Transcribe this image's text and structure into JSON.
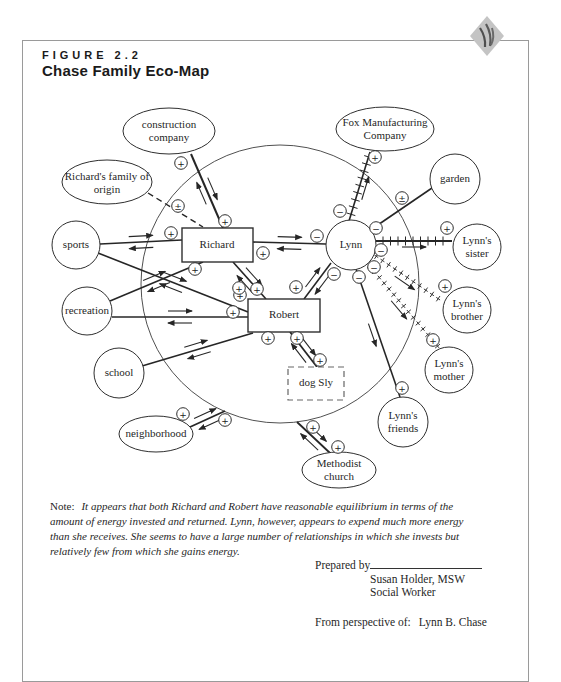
{
  "header": {
    "figure_label": "FIGURE 2.2",
    "title": "Chase Family Eco-Map"
  },
  "diagram": {
    "big_circle": {
      "cx": 280,
      "cy": 284,
      "r": 139
    },
    "nodes": [
      {
        "id": "construction-company",
        "label": "construction company",
        "shape": "ellipse",
        "cx": 169,
        "cy": 131,
        "rx": 46,
        "ry": 23
      },
      {
        "id": "fox-manufacturing",
        "label": "Fox Manufacturing Company",
        "shape": "ellipse",
        "cx": 385,
        "cy": 129,
        "rx": 49,
        "ry": 22
      },
      {
        "id": "richards-family-of-origin",
        "label": "Richard's family of origin",
        "shape": "ellipse",
        "cx": 107,
        "cy": 182,
        "rx": 45,
        "ry": 22
      },
      {
        "id": "garden",
        "label": "garden",
        "shape": "ellipse",
        "cx": 455,
        "cy": 179,
        "rx": 25,
        "ry": 25
      },
      {
        "id": "sports",
        "label": "sports",
        "shape": "ellipse",
        "cx": 76,
        "cy": 245,
        "rx": 24,
        "ry": 24
      },
      {
        "id": "lynns-sister",
        "label": "Lynn's sister",
        "shape": "ellipse",
        "cx": 477,
        "cy": 247,
        "rx": 24,
        "ry": 23
      },
      {
        "id": "lynn",
        "label": "Lynn",
        "shape": "ellipse",
        "cx": 351,
        "cy": 245,
        "rx": 25,
        "ry": 25
      },
      {
        "id": "richard",
        "label": "Richard",
        "shape": "rect",
        "x": 182,
        "y": 228,
        "w": 71,
        "h": 34
      },
      {
        "id": "recreation",
        "label": "recreation",
        "shape": "ellipse",
        "cx": 87,
        "cy": 311,
        "rx": 25,
        "ry": 24
      },
      {
        "id": "lynns-brother",
        "label": "Lynn's brother",
        "shape": "ellipse",
        "cx": 467,
        "cy": 310,
        "rx": 24,
        "ry": 23
      },
      {
        "id": "robert",
        "label": "Robert",
        "shape": "rect",
        "x": 248,
        "y": 299,
        "w": 72,
        "h": 33
      },
      {
        "id": "lynns-mother",
        "label": "Lynn's mother",
        "shape": "ellipse",
        "cx": 449,
        "cy": 370,
        "rx": 24,
        "ry": 23
      },
      {
        "id": "school",
        "label": "school",
        "shape": "ellipse",
        "cx": 119,
        "cy": 373,
        "rx": 25,
        "ry": 25
      },
      {
        "id": "dog-sly",
        "label": "dog Sly",
        "shape": "rect-dashed",
        "x": 288,
        "y": 367,
        "w": 56,
        "h": 33
      },
      {
        "id": "lynns-friends",
        "label": "Lynn's friends",
        "shape": "ellipse",
        "cx": 403,
        "cy": 422,
        "rx": 25,
        "ry": 25
      },
      {
        "id": "neighborhood",
        "label": "neighborhood",
        "shape": "ellipse",
        "cx": 156,
        "cy": 434,
        "rx": 37,
        "ry": 18
      },
      {
        "id": "methodist-church",
        "label": "Methodist church",
        "shape": "ellipse",
        "cx": 339,
        "cy": 470,
        "rx": 37,
        "ry": 18
      }
    ],
    "connections": [
      {
        "id": "construction-richard",
        "x1": 191,
        "y1": 154,
        "x2": 223,
        "y2": 228,
        "style": "solid",
        "w": 2,
        "arrows": "both"
      },
      {
        "id": "familyoforigin-richard",
        "x1": 148,
        "y1": 193,
        "x2": 203,
        "y2": 227,
        "style": "dashed",
        "w": 1.4,
        "arrows": "none"
      },
      {
        "id": "sports-richard",
        "x1": 100,
        "y1": 244,
        "x2": 182,
        "y2": 240,
        "style": "solid",
        "w": 1.6,
        "arrows": "both"
      },
      {
        "id": "sports-robert",
        "x1": 98,
        "y1": 253,
        "x2": 248,
        "y2": 312,
        "style": "solid",
        "w": 1.6,
        "arrows": "both"
      },
      {
        "id": "recreation-richard",
        "x1": 110,
        "y1": 301,
        "x2": 203,
        "y2": 262,
        "style": "solid",
        "w": 1.6,
        "arrows": "both"
      },
      {
        "id": "recreation-robert",
        "x1": 112,
        "y1": 317,
        "x2": 248,
        "y2": 317,
        "style": "solid",
        "w": 1.6,
        "arrows": "both"
      },
      {
        "id": "school-robert",
        "x1": 142,
        "y1": 366,
        "x2": 253,
        "y2": 333,
        "style": "solid",
        "w": 1.6,
        "arrows": "both"
      },
      {
        "id": "richard-lynn",
        "x1": 253,
        "y1": 242,
        "x2": 326,
        "y2": 244,
        "style": "solid",
        "w": 1.6,
        "arrows": "both"
      },
      {
        "id": "richard-robert",
        "x1": 233,
        "y1": 262,
        "x2": 266,
        "y2": 299,
        "style": "solid",
        "w": 1.6,
        "arrows": "both"
      },
      {
        "id": "lynn-robert",
        "x1": 331,
        "y1": 263,
        "x2": 304,
        "y2": 299,
        "style": "solid",
        "w": 1.6,
        "arrows": "both"
      },
      {
        "id": "lynn-fox",
        "x1": 349,
        "y1": 221,
        "x2": 370,
        "y2": 152,
        "style": "hatched",
        "w": 1.6,
        "arrows": "out"
      },
      {
        "id": "lynn-garden",
        "x1": 369,
        "y1": 231,
        "x2": 432,
        "y2": 188,
        "style": "solid",
        "w": 1.6,
        "arrows": "none"
      },
      {
        "id": "lynn-sister",
        "x1": 376,
        "y1": 241,
        "x2": 452,
        "y2": 241,
        "style": "hatched",
        "w": 1.8,
        "arrows": "out"
      },
      {
        "id": "lynn-brother",
        "x1": 373,
        "y1": 254,
        "x2": 443,
        "y2": 302,
        "style": "crossed",
        "w": 1,
        "arrows": "out"
      },
      {
        "id": "lynn-mother",
        "x1": 367,
        "y1": 263,
        "x2": 440,
        "y2": 349,
        "style": "crossed",
        "w": 1,
        "arrows": "out"
      },
      {
        "id": "lynn-friends",
        "x1": 356,
        "y1": 269,
        "x2": 400,
        "y2": 397,
        "style": "solid",
        "w": 1.6,
        "arrows": "out"
      },
      {
        "id": "robert-dogsly",
        "x1": 290,
        "y1": 332,
        "x2": 317,
        "y2": 367,
        "style": "solid",
        "w": 1.8,
        "arrows": "both"
      },
      {
        "id": "neighborhood-family",
        "x1": 190,
        "y1": 427,
        "x2": 225,
        "y2": 411,
        "style": "solid",
        "w": 1.8,
        "arrows": "both"
      },
      {
        "id": "family-methodist",
        "x1": 297,
        "y1": 422,
        "x2": 330,
        "y2": 453,
        "style": "solid",
        "w": 1.8,
        "arrows": "both"
      }
    ],
    "symbols": [
      {
        "t": "+",
        "x": 181,
        "y": 163
      },
      {
        "t": "+",
        "x": 225,
        "y": 221
      },
      {
        "t": "±",
        "x": 178,
        "y": 206
      },
      {
        "t": "+",
        "x": 171,
        "y": 233
      },
      {
        "t": "+",
        "x": 195,
        "y": 269
      },
      {
        "t": "+",
        "x": 263,
        "y": 253
      },
      {
        "t": "+",
        "x": 240,
        "y": 295
      },
      {
        "t": "+",
        "x": 233,
        "y": 312
      },
      {
        "t": "+",
        "x": 239,
        "y": 288
      },
      {
        "t": "+",
        "x": 257,
        "y": 289
      },
      {
        "t": "+",
        "x": 296,
        "y": 287
      },
      {
        "t": "+",
        "x": 268,
        "y": 338
      },
      {
        "t": "+",
        "x": 297,
        "y": 338
      },
      {
        "t": "+",
        "x": 320,
        "y": 360
      },
      {
        "t": "+",
        "x": 183,
        "y": 414
      },
      {
        "t": "+",
        "x": 225,
        "y": 420
      },
      {
        "t": "+",
        "x": 313,
        "y": 427
      },
      {
        "t": "+",
        "x": 338,
        "y": 447
      },
      {
        "t": "+",
        "x": 375,
        "y": 157
      },
      {
        "t": "±",
        "x": 402,
        "y": 198
      },
      {
        "t": "+",
        "x": 447,
        "y": 228
      },
      {
        "t": "+",
        "x": 445,
        "y": 286
      },
      {
        "t": "+",
        "x": 433,
        "y": 340
      },
      {
        "t": "+",
        "x": 402,
        "y": 388
      },
      {
        "t": "−",
        "x": 340,
        "y": 211
      },
      {
        "t": "−",
        "x": 317,
        "y": 236
      },
      {
        "t": "−",
        "x": 376,
        "y": 228
      },
      {
        "t": "−",
        "x": 381,
        "y": 250
      },
      {
        "t": "−",
        "x": 374,
        "y": 267
      },
      {
        "t": "−",
        "x": 359,
        "y": 277
      },
      {
        "t": "−",
        "x": 334,
        "y": 274
      }
    ]
  },
  "note": {
    "prefix": "Note:",
    "text": "It appears that both Richard and Robert have reasonable equilibrium in terms of the amount of energy invested and returned. Lynn, however, appears to expend much more energy than she receives. She seems to have a large number of relationships in which she invests but relatively few from which she gains energy."
  },
  "footer": {
    "prepared_by_label": "Prepared by",
    "prepared_by_name": "Susan Holder, MSW",
    "prepared_by_title": "Social Worker",
    "perspective_label": "From perspective of:",
    "perspective_name": "Lynn B. Chase"
  },
  "colors": {
    "line": "#262626",
    "border": "#9a9a9a",
    "logo_fill": "#c4c4c4",
    "logo_mark": "#4f4f4f"
  }
}
